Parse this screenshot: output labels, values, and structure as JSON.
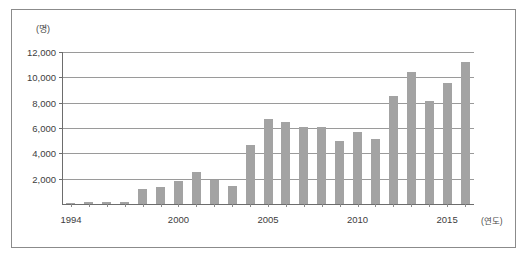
{
  "chart_data": {
    "type": "bar",
    "title": "",
    "subtitle": "",
    "xlabel": "(연도)",
    "ylabel": "(명)",
    "ylim": [
      0,
      12000
    ],
    "ytick_labels": [
      "12,000",
      "10,000",
      "8,000",
      "6,000",
      "4,000",
      "2,000"
    ],
    "ytick_values": [
      12000,
      10000,
      8000,
      6000,
      4000,
      2000
    ],
    "xtick_labels": [
      "1994",
      "2000",
      "2005",
      "2010",
      "2015"
    ],
    "xtick_values": [
      1994,
      2000,
      2005,
      2010,
      2015
    ],
    "grid": true,
    "legend": null,
    "legend_position": "none",
    "bar_color": "#a3a3a3",
    "axis_color": "#6d6d6d",
    "grid_color": "#9a9a9a",
    "categories": [
      "1994",
      "1995",
      "1996",
      "1997",
      "1998",
      "1999",
      "2000",
      "2001",
      "2002",
      "2003",
      "2004",
      "2005",
      "2006",
      "2007",
      "2008",
      "2009",
      "2010",
      "2011",
      "2012",
      "2013",
      "2014",
      "2015",
      "2016"
    ],
    "values": [
      50,
      150,
      150,
      150,
      1150,
      1350,
      1800,
      2500,
      1900,
      1400,
      4650,
      6750,
      6450,
      6050,
      6050,
      4950,
      5650,
      5150,
      8550,
      10400,
      8150,
      9550,
      11200
    ]
  },
  "figure": {
    "unit_label_y": "(명)",
    "unit_label_x": "(연도)"
  }
}
